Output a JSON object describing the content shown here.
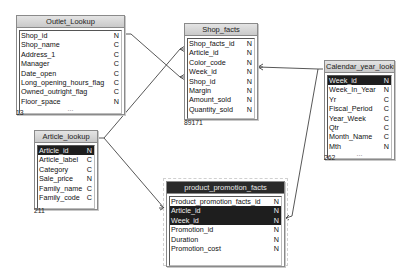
{
  "tables": {
    "outlet": {
      "title": "Outlet_Lookup",
      "count": "13",
      "columns": [
        {
          "name": "Shop_id",
          "type": "N"
        },
        {
          "name": "Shop_name",
          "type": "C"
        },
        {
          "name": "Address_1",
          "type": "C"
        },
        {
          "name": "Manager",
          "type": "C"
        },
        {
          "name": "Date_open",
          "type": "C"
        },
        {
          "name": "Long_opening_hours_flag",
          "type": "C"
        },
        {
          "name": "Owned_outright_flag",
          "type": "C"
        },
        {
          "name": "Floor_space",
          "type": "N"
        }
      ],
      "more": "..."
    },
    "shop_facts": {
      "title": "Shop_facts",
      "count": "89171",
      "columns": [
        {
          "name": "Shop_facts_id",
          "type": "N"
        },
        {
          "name": "Article_id",
          "type": "N"
        },
        {
          "name": "Color_code",
          "type": "N"
        },
        {
          "name": "Week_id",
          "type": "N"
        },
        {
          "name": "Shop_id",
          "type": "N"
        },
        {
          "name": "Margin",
          "type": "N"
        },
        {
          "name": "Amount_sold",
          "type": "N"
        },
        {
          "name": "Quantity_sold",
          "type": "N"
        }
      ]
    },
    "calendar": {
      "title": "Calendar_year_lookup",
      "count": "262",
      "columns": [
        {
          "name": "Week_id",
          "type": "N"
        },
        {
          "name": "Week_In_Year",
          "type": "N"
        },
        {
          "name": "Yr",
          "type": "C"
        },
        {
          "name": "Fiscal_Period",
          "type": "C"
        },
        {
          "name": "Year_Week",
          "type": "C"
        },
        {
          "name": "Qtr",
          "type": "C"
        },
        {
          "name": "Month_Name",
          "type": "C"
        },
        {
          "name": "Mth",
          "type": "N"
        }
      ],
      "more": "..."
    },
    "article": {
      "title": "Article_lookup",
      "count": "211",
      "columns": [
        {
          "name": "Article_id",
          "type": "N"
        },
        {
          "name": "Article_label",
          "type": "C"
        },
        {
          "name": "Category",
          "type": "C"
        },
        {
          "name": "Sale_price",
          "type": "N"
        },
        {
          "name": "Family_name",
          "type": "C"
        },
        {
          "name": "Family_code",
          "type": "C"
        }
      ]
    },
    "promotion": {
      "title": "product_promotion_facts",
      "columns": [
        {
          "name": "Product_promotion_facts_id",
          "type": "N"
        },
        {
          "name": "Article_id",
          "type": "N"
        },
        {
          "name": "Week_id",
          "type": "N"
        },
        {
          "name": "Promotion_id",
          "type": "N"
        },
        {
          "name": "Duration",
          "type": "N"
        },
        {
          "name": "Promotion_cost",
          "type": "N"
        }
      ]
    }
  },
  "colors": {
    "selected_row_bg": "#1e1e1e",
    "header_bg": "#d4d4d4",
    "selected_header_bg": "#2a2a2a",
    "link_line": "#444444"
  }
}
